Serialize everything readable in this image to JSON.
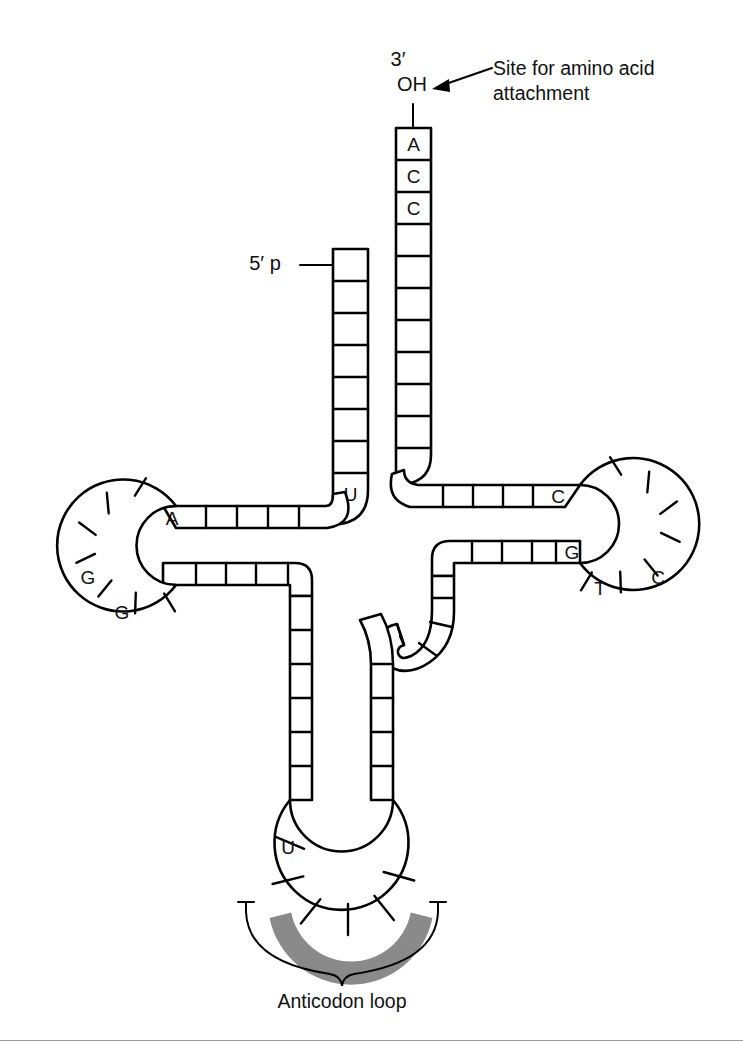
{
  "figure": {
    "background_color": "#ffffff",
    "line_color": "#000000",
    "shade_color": "#8a8a8a"
  },
  "annotations": {
    "three_prime": "3′",
    "oh": "OH",
    "five_prime": "5′ p",
    "amino_acid_site_line1": "Site for amino acid",
    "amino_acid_site_line2": "attachment",
    "anticodon_loop": "Anticodon loop"
  },
  "acceptor_stem": {
    "three_prime_strand_bases": [
      "A",
      "C",
      "C",
      "",
      "",
      "",
      "",
      "",
      "",
      "",
      ""
    ],
    "five_prime_strand_bases": [
      "",
      "",
      "",
      "",
      "",
      "",
      "",
      "U"
    ]
  },
  "d_arm": {
    "upper_stem_bases": [
      "A",
      "",
      "",
      "",
      ""
    ],
    "lower_stem_bases": [
      "",
      "",
      "",
      "",
      ""
    ],
    "loop_bases": [
      "",
      "",
      "",
      "G",
      "G",
      "",
      "",
      ""
    ],
    "labeled": {
      "A": "A",
      "G1": "G",
      "G2": "G"
    }
  },
  "t_arm": {
    "upper_stem_bases": [
      "",
      "",
      "",
      "C"
    ],
    "lower_stem_bases": [
      "",
      "",
      "",
      "G"
    ],
    "loop_bases": [
      "",
      "",
      "",
      "",
      "C",
      "",
      "T"
    ],
    "labeled": {
      "C_stem": "C",
      "G_stem": "G",
      "T_loop": "T",
      "C_loop": "C"
    }
  },
  "anticodon_arm": {
    "left_stem_bases": [
      "",
      "",
      "",
      "",
      "",
      ""
    ],
    "right_stem_bases": [
      "",
      "",
      "",
      "",
      "",
      ""
    ],
    "loop_bases": [
      "U",
      "",
      "",
      "",
      "",
      "",
      ""
    ],
    "labeled": {
      "U": "U"
    },
    "shaded_count": 3
  },
  "variable_loop": {
    "bases": [
      "",
      "",
      "",
      "",
      "",
      ""
    ]
  }
}
